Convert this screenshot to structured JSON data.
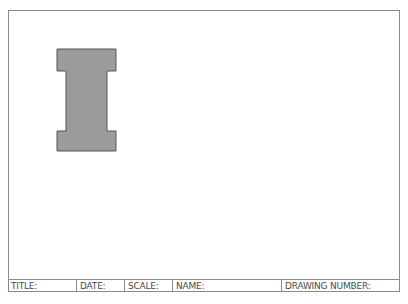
{
  "drawing": {
    "shape": {
      "type": "i-beam",
      "fill": "#9b9b9b",
      "stroke": "#555555",
      "points": "57,49 116,49 116,71 107,71 107,131 116,131 116,151 57,151 57,131 66,131 66,71 57,71"
    }
  },
  "title_block": {
    "fields": [
      {
        "label": "TITLE:",
        "width": 69
      },
      {
        "label": "DATE:",
        "width": 48
      },
      {
        "label": "SCALE:",
        "width": 48
      },
      {
        "label": "NAME:",
        "width": 109
      },
      {
        "label": "DRAWING NUMBER:",
        "width": 118
      }
    ]
  },
  "colors": {
    "border": "#8a8a8a",
    "text": "#4a4a4a",
    "shape_fill": "#9b9b9b"
  }
}
